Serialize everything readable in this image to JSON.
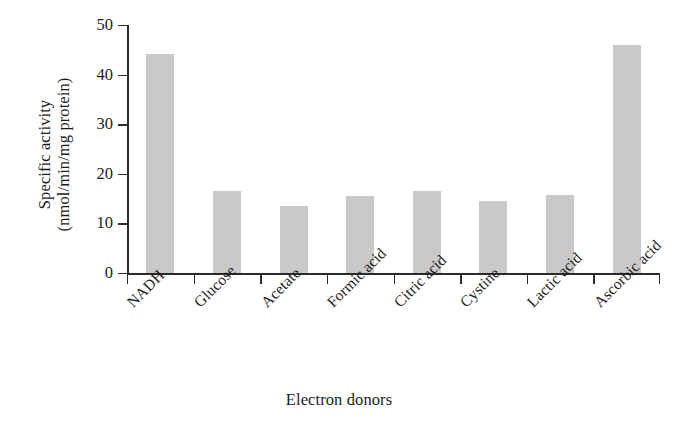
{
  "chart_data": {
    "type": "bar",
    "title": "",
    "xlabel": "Electron donors",
    "ylabel": "Specific activity (nmol/min/mg protein)",
    "ylabel_line1": "Specific activity",
    "ylabel_line2": "(nmol/min/mg protein)",
    "categories": [
      "NADH",
      "Glucose",
      "Acetate",
      "Formic acid",
      "Citric acid",
      "Cystine",
      "Lactic acid",
      "Ascorbic acid"
    ],
    "values": [
      44.2,
      16.5,
      13.5,
      15.5,
      16.6,
      14.5,
      15.8,
      46.0
    ],
    "ylim": [
      0,
      50
    ],
    "yticks": [
      0,
      10,
      20,
      30,
      40,
      50
    ],
    "ytick_labels": [
      "0",
      "10",
      "20",
      "30",
      "40",
      "50"
    ],
    "grid": false,
    "legend": false,
    "bar_color": "#c9c9c9",
    "axis_color": "#2a2a2a",
    "series": [
      {
        "name": "Specific activity",
        "values": [
          44.2,
          16.5,
          13.5,
          15.5,
          16.6,
          14.5,
          15.8,
          46.0
        ]
      }
    ]
  }
}
